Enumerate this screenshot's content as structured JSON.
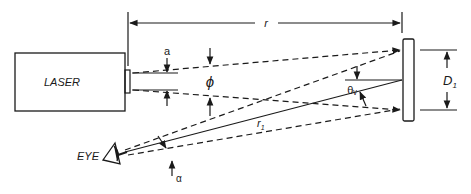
{
  "diagram": {
    "type": "laser-viewing-geometry",
    "labels": {
      "laser": "LASER",
      "eye": "EYE",
      "distance": "r",
      "aperture": "a",
      "divergence": "ϕ",
      "theta": "θᵥ",
      "spot_diameter": "D",
      "spot_diameter_sub": "1",
      "view_distance": "r",
      "view_distance_sub": "1",
      "alpha": "α"
    },
    "colors": {
      "ink": "#1a1a1a",
      "background": "#ffffff"
    }
  }
}
